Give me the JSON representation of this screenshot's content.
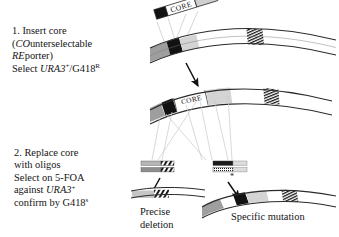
{
  "figure": {
    "background": "#ffffff",
    "ink": "#151515"
  },
  "steps": [
    {
      "id": "step1",
      "number": "1.",
      "lines": [
        {
          "segments": [
            {
              "text": "1. Insert core",
              "style": "roman"
            }
          ]
        },
        {
          "segments": [
            {
              "text": "(",
              "style": "roman"
            },
            {
              "text": "CO",
              "style": "italic"
            },
            {
              "text": "unterselectable",
              "style": "roman"
            }
          ]
        },
        {
          "segments": [
            {
              "text": "RE",
              "style": "italic"
            },
            {
              "text": "porter)",
              "style": "roman"
            }
          ]
        },
        {
          "segments": [
            {
              "text": "Select ",
              "style": "roman"
            },
            {
              "text": "URA3",
              "style": "italic"
            },
            {
              "text": "+",
              "style": "super"
            },
            {
              "text": "/G418",
              "style": "roman"
            },
            {
              "text": "R",
              "style": "super"
            }
          ]
        }
      ]
    },
    {
      "id": "step2",
      "number": "2.",
      "lines": [
        {
          "segments": [
            {
              "text": "2. Replace core",
              "style": "roman"
            }
          ]
        },
        {
          "segments": [
            {
              "text": "with oligos",
              "style": "roman"
            }
          ]
        },
        {
          "segments": [
            {
              "text": "Select on 5-FOA",
              "style": "roman"
            }
          ]
        },
        {
          "segments": [
            {
              "text": "against ",
              "style": "roman"
            },
            {
              "text": "URA3",
              "style": "italic"
            },
            {
              "text": "+",
              "style": "super"
            }
          ]
        },
        {
          "segments": [
            {
              "text": "confirm by G418",
              "style": "roman"
            },
            {
              "text": "s",
              "style": "super"
            }
          ]
        }
      ]
    }
  ],
  "captions": {
    "precise_deletion": "Precise\ndeletion",
    "precise_deletion_line1": "Precise",
    "precise_deletion_line2": "deletion",
    "specific_mutation": "Specific mutation"
  },
  "cassette": {
    "label": "CORE",
    "label_inserted": "CORE"
  },
  "colors": {
    "black_segment": "#121212",
    "grey_segment": "#9a9a9a",
    "light_grey_segment": "#d2d2d2",
    "outline": "#2b2b2b",
    "guide_line": "#c8c8c8",
    "arrow": "#101010",
    "dna_fill": "#ffffff"
  },
  "elements": {
    "top_chromosome": "upper DNA duplex arc with target locus",
    "donor_cassette": "CORE cassette donor fragment, tilted",
    "middle_chromosome": "chromosome with CORE cassette integrated",
    "oligo_pair_left": "deletion oligonucleotide pair (hatched)",
    "oligo_pair_right": "mutagenic oligonucleotide pair (hatched, asterisk)",
    "bottom_left_product": "precise deletion product duplex",
    "bottom_right_product": "specific mutation product duplex",
    "asterisk_marker": "*"
  }
}
